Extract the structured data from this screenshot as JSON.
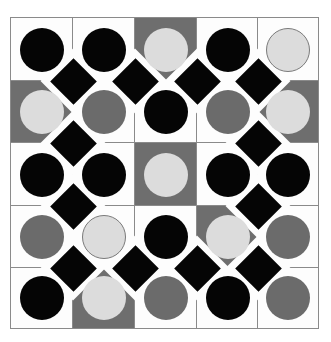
{
  "board": {
    "rows": 5,
    "cols": 5,
    "colors": {
      "white": "#fdfdfd",
      "gray_bg": "#6e6e6e",
      "black": "#050505",
      "gray": "#6b6b6b",
      "light": "#dcdcdc",
      "grid_line": "#8a8a8a"
    },
    "cells": [
      [
        {
          "bg": "white",
          "circle": "black"
        },
        {
          "bg": "white",
          "circle": "black"
        },
        {
          "bg": "gray",
          "circle": "light"
        },
        {
          "bg": "white",
          "circle": "black"
        },
        {
          "bg": "white",
          "circle": "light",
          "outlined": true
        }
      ],
      [
        {
          "bg": "gray",
          "circle": "light"
        },
        {
          "bg": "white",
          "circle": "gray"
        },
        {
          "bg": "white",
          "circle": "black"
        },
        {
          "bg": "white",
          "circle": "gray"
        },
        {
          "bg": "gray",
          "circle": "light"
        }
      ],
      [
        {
          "bg": "white",
          "circle": "black"
        },
        {
          "bg": "white",
          "circle": "black"
        },
        {
          "bg": "gray",
          "circle": "light"
        },
        {
          "bg": "white",
          "circle": "black"
        },
        {
          "bg": "white",
          "circle": "black"
        }
      ],
      [
        {
          "bg": "white",
          "circle": "gray"
        },
        {
          "bg": "white",
          "circle": "light",
          "outlined": true
        },
        {
          "bg": "white",
          "circle": "black"
        },
        {
          "bg": "gray",
          "circle": "light"
        },
        {
          "bg": "white",
          "circle": "gray"
        }
      ],
      [
        {
          "bg": "white",
          "circle": "black"
        },
        {
          "bg": "gray",
          "circle": "light"
        },
        {
          "bg": "white",
          "circle": "gray"
        },
        {
          "bg": "white",
          "circle": "black"
        },
        {
          "bg": "white",
          "circle": "gray"
        }
      ]
    ],
    "diamonds": [
      [
        1,
        1
      ],
      [
        1,
        2
      ],
      [
        1,
        3
      ],
      [
        1,
        4
      ],
      [
        2,
        1
      ],
      [
        2,
        4
      ],
      [
        3,
        1
      ],
      [
        3,
        4
      ],
      [
        4,
        1
      ],
      [
        4,
        2
      ],
      [
        4,
        3
      ],
      [
        4,
        4
      ]
    ]
  }
}
